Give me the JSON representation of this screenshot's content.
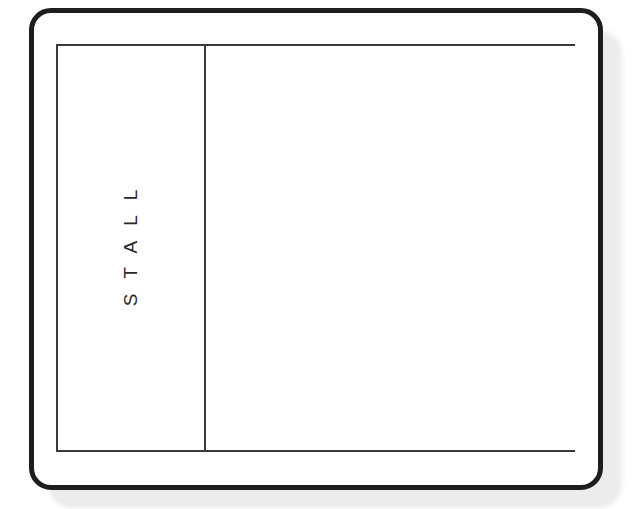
{
  "diagram": {
    "type": "stall-layout",
    "regions": [
      {
        "id": "stall",
        "label": "STALL",
        "orientation": "vertical"
      },
      {
        "id": "open-area",
        "label": ""
      }
    ]
  }
}
